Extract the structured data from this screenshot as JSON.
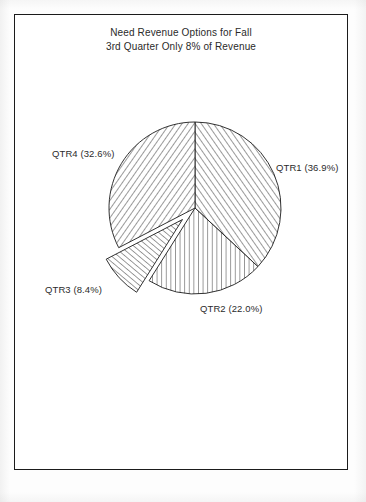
{
  "document": {
    "title_line_1": "Need Revenue Options for Fall",
    "title_line_2": "3rd Quarter Only 8% of Revenue"
  },
  "colors": {
    "ink": "#1b1b1b",
    "text": "#2a2a2a",
    "hatch": "#3a3a3a",
    "paper": "#ffffff"
  },
  "chart_data": {
    "type": "pie",
    "title": "Need Revenue Options for Fall",
    "subtitle": "3rd Quarter Only 8% of Revenue",
    "categories": [
      "QTR1",
      "QTR2",
      "QTR3",
      "QTR4"
    ],
    "values": [
      36.9,
      22.0,
      8.4,
      32.6
    ],
    "value_unit": "percent",
    "start_angle_deg": 0,
    "direction": "clockwise",
    "exploded_slices": [
      "QTR3"
    ],
    "legend": "none",
    "labels": [
      {
        "key": "qtr1",
        "name": "QTR1",
        "value": 36.9,
        "text": "QTR1 (36.9%)",
        "hatch": "diagonal-up"
      },
      {
        "key": "qtr2",
        "name": "QTR2",
        "value": 22.0,
        "text": "QTR2 (22.0%)",
        "hatch": "vertical"
      },
      {
        "key": "qtr3",
        "name": "QTR3",
        "value": 8.4,
        "text": "QTR3 (8.4%)",
        "hatch": "diagonal-up-fine"
      },
      {
        "key": "qtr4",
        "name": "QTR4",
        "value": 32.6,
        "text": "QTR4 (32.6%)",
        "hatch": "diagonal-down"
      }
    ]
  }
}
